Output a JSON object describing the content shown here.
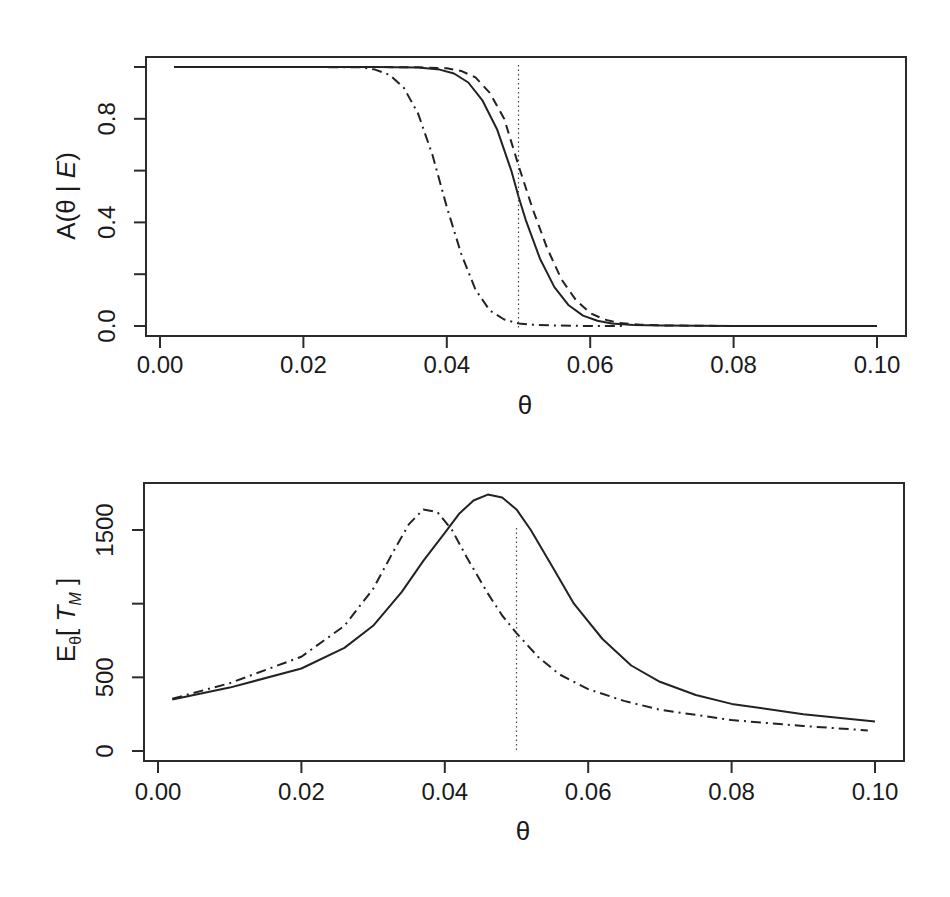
{
  "chart_data": [
    {
      "type": "line",
      "title": "",
      "xlabel": "θ",
      "ylabel": "A(θ | E)",
      "xlim": [
        0.0,
        0.1
      ],
      "ylim": [
        0.0,
        1.0
      ],
      "x_ticks": [
        "0.00",
        "0.02",
        "0.04",
        "0.06",
        "0.08",
        "0.10"
      ],
      "y_ticks": [
        "0.0",
        "0.4",
        "0.8"
      ],
      "y_minor_ticks": [
        0.0,
        0.2,
        0.4,
        0.6,
        0.8,
        1.0
      ],
      "grid": false,
      "legend": null,
      "reference_line": {
        "axis": "x",
        "value": 0.05,
        "style": "dotted"
      },
      "series": [
        {
          "name": "solid",
          "style": "solid",
          "x": [
            0.002,
            0.01,
            0.02,
            0.03,
            0.036,
            0.039,
            0.041,
            0.043,
            0.045,
            0.047,
            0.049,
            0.05,
            0.051,
            0.053,
            0.055,
            0.057,
            0.059,
            0.061,
            0.063,
            0.066,
            0.07,
            0.08,
            0.09,
            0.1
          ],
          "values": [
            1.0,
            1.0,
            1.0,
            1.0,
            0.998,
            0.99,
            0.975,
            0.94,
            0.87,
            0.76,
            0.6,
            0.5,
            0.41,
            0.26,
            0.15,
            0.08,
            0.04,
            0.02,
            0.01,
            0.004,
            0.002,
            0.0,
            0.0,
            0.0
          ]
        },
        {
          "name": "dashed",
          "style": "dashed",
          "x": [
            0.002,
            0.01,
            0.02,
            0.03,
            0.036,
            0.04,
            0.042,
            0.044,
            0.046,
            0.048,
            0.05,
            0.052,
            0.054,
            0.056,
            0.058,
            0.06,
            0.062,
            0.064,
            0.067,
            0.07,
            0.08,
            0.09,
            0.1
          ],
          "values": [
            1.0,
            1.0,
            1.0,
            1.0,
            0.999,
            0.995,
            0.985,
            0.96,
            0.9,
            0.8,
            0.62,
            0.45,
            0.3,
            0.18,
            0.1,
            0.05,
            0.025,
            0.012,
            0.005,
            0.002,
            0.0,
            0.0,
            0.0
          ]
        },
        {
          "name": "dot-dash",
          "style": "dashdot",
          "x": [
            0.002,
            0.02,
            0.028,
            0.03,
            0.032,
            0.034,
            0.036,
            0.038,
            0.04,
            0.042,
            0.044,
            0.046,
            0.048,
            0.05,
            0.052,
            0.055,
            0.06,
            0.065
          ],
          "values": [
            1.0,
            1.0,
            0.999,
            0.99,
            0.97,
            0.92,
            0.82,
            0.66,
            0.46,
            0.28,
            0.14,
            0.06,
            0.025,
            0.01,
            0.005,
            0.002,
            0.0,
            0.0
          ]
        }
      ]
    },
    {
      "type": "line",
      "title": "",
      "xlabel": "θ",
      "ylabel": "Eθ[ T_M ]",
      "xlim": [
        0.0,
        0.1
      ],
      "ylim": [
        0,
        1700
      ],
      "x_ticks": [
        "0.00",
        "0.02",
        "0.04",
        "0.06",
        "0.08",
        "0.10"
      ],
      "y_ticks": [
        "0",
        "500",
        "1500"
      ],
      "y_minor_ticks": [
        0,
        500,
        1000,
        1500
      ],
      "grid": false,
      "legend": null,
      "reference_line": {
        "axis": "x",
        "value": 0.05,
        "style": "dotted"
      },
      "series": [
        {
          "name": "solid",
          "style": "solid",
          "x": [
            0.002,
            0.01,
            0.02,
            0.026,
            0.03,
            0.034,
            0.037,
            0.04,
            0.042,
            0.044,
            0.046,
            0.048,
            0.05,
            0.052,
            0.055,
            0.058,
            0.062,
            0.066,
            0.07,
            0.075,
            0.08,
            0.09,
            0.1
          ],
          "values": [
            350,
            430,
            560,
            700,
            850,
            1080,
            1290,
            1480,
            1610,
            1700,
            1740,
            1720,
            1640,
            1500,
            1250,
            1000,
            760,
            580,
            470,
            380,
            320,
            250,
            200
          ]
        },
        {
          "name": "dot-dash",
          "style": "dashdot",
          "x": [
            0.002,
            0.01,
            0.02,
            0.026,
            0.03,
            0.033,
            0.035,
            0.037,
            0.039,
            0.041,
            0.043,
            0.046,
            0.048,
            0.05,
            0.053,
            0.056,
            0.06,
            0.065,
            0.07,
            0.08,
            0.09,
            0.099
          ],
          "values": [
            355,
            460,
            640,
            850,
            1100,
            1370,
            1540,
            1640,
            1620,
            1500,
            1320,
            1070,
            920,
            800,
            640,
            520,
            420,
            340,
            280,
            210,
            170,
            140
          ]
        }
      ]
    }
  ],
  "panels": [
    {
      "ylabel_main": "A(θ | ",
      "ylabel_italic": "E",
      "ylabel_close": ")",
      "xlabel": "θ"
    },
    {
      "ylabel_main": "E",
      "ylabel_sub": "θ",
      "ylabel_open": "[ ",
      "ylabel_italic": "T",
      "ylabel_italic_sub": "M",
      "ylabel_close": " ]",
      "xlabel": "θ"
    }
  ]
}
